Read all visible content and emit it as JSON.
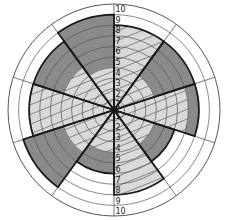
{
  "diagram": {
    "type": "radial-wheel",
    "center": [
      114,
      110
    ],
    "outer_radius": 106,
    "rings": 10,
    "sector_count": 10,
    "colors": {
      "background": "#ffffff",
      "grid_line": "#555555",
      "hatched_fill": "#d9d9d9",
      "hatch_line": "#3a3a3a",
      "dark_fill": "#8a8a8a",
      "outline": "#1a1a1a"
    },
    "scale_labels_up": [
      "1",
      "2",
      "3",
      "4",
      "5",
      "6",
      "7",
      "8",
      "9",
      "10"
    ],
    "scale_labels_down": [
      "1",
      "2",
      "3",
      "4",
      "5",
      "6",
      "7",
      "8",
      "9",
      "10"
    ],
    "sectors": [
      {
        "index": 1,
        "start_deg": 0,
        "end_deg": 36,
        "hatched_to": 8,
        "dark_from": null,
        "dark_to": null
      },
      {
        "index": 2,
        "start_deg": 36,
        "end_deg": 72,
        "hatched_to": 4,
        "dark_from": 4,
        "dark_to": 8
      },
      {
        "index": 3,
        "start_deg": 72,
        "end_deg": 108,
        "hatched_to": 7,
        "dark_from": 7,
        "dark_to": 8
      },
      {
        "index": 4,
        "start_deg": 108,
        "end_deg": 144,
        "hatched_to": 4,
        "dark_from": 4,
        "dark_to": 6
      },
      {
        "index": 5,
        "start_deg": 144,
        "end_deg": 180,
        "hatched_to": 8,
        "dark_from": null,
        "dark_to": null
      },
      {
        "index": 6,
        "start_deg": 180,
        "end_deg": 216,
        "hatched_to": 4,
        "dark_from": 4,
        "dark_to": 6
      },
      {
        "index": 7,
        "start_deg": 216,
        "end_deg": 252,
        "hatched_to": 5,
        "dark_from": 5,
        "dark_to": 9
      },
      {
        "index": 8,
        "start_deg": 252,
        "end_deg": 288,
        "hatched_to": 8,
        "dark_from": null,
        "dark_to": null
      },
      {
        "index": 9,
        "start_deg": 288,
        "end_deg": 324,
        "hatched_to": 5,
        "dark_from": 5,
        "dark_to": 8
      },
      {
        "index": 10,
        "start_deg": 324,
        "end_deg": 360,
        "hatched_to": 4,
        "dark_from": 4,
        "dark_to": 9
      }
    ]
  }
}
